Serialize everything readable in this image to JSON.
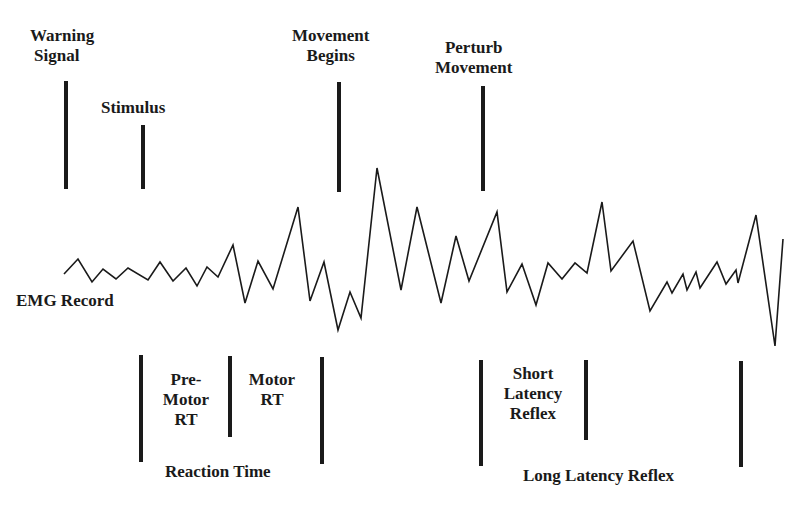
{
  "top_markers": [
    {
      "id": "warning-signal",
      "lines": [
        "Warning",
        "Signal"
      ]
    },
    {
      "id": "stimulus",
      "lines": [
        "Stimulus"
      ]
    },
    {
      "id": "movement-begins",
      "lines": [
        "Movement",
        "Begins"
      ]
    },
    {
      "id": "perturb-movement",
      "lines": [
        "Perturb",
        "Movement"
      ]
    }
  ],
  "emg": {
    "label": "EMG Record",
    "points": "64,274 78,259 92,282 103,269 116,279 128,268 148,280 160,262 173,281 186,268 197,286 207,267 218,277 233,245 245,303 258,261 273,289 298,207 310,301 324,262 338,330 350,292 361,318 377,168 401,290 417,207 441,303 456,236 469,281 497,212 507,292 522,264 536,305 548,263 562,279 575,263 587,273 602,202 611,271 633,241 650,311 667,282 672,293 683,274 687,290 696,272 700,288 717,262 726,284 736,270 738,283 756,215 775,346 783,239"
  },
  "intervals": {
    "premotor": [
      "Pre-",
      "Motor",
      "RT"
    ],
    "motor": [
      "Motor",
      "RT"
    ],
    "reaction_time": "Reaction Time",
    "short_latency": [
      "Short",
      "Latency",
      "Reflex"
    ],
    "long_latency": "Long Latency Reflex"
  }
}
